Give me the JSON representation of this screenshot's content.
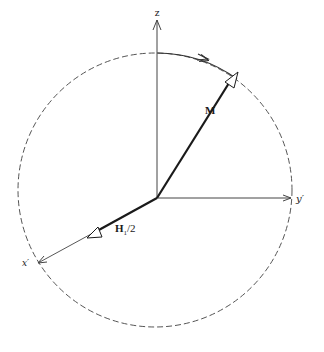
{
  "diagram": {
    "title": "",
    "colors": {
      "background": "#ffffff",
      "line": "#1a1a1a",
      "axis": "#444444",
      "circle": "#555555"
    },
    "axes": {
      "z": {
        "label": "z"
      },
      "y": {
        "label": "y′"
      },
      "x": {
        "label": "x′"
      }
    },
    "vectors": {
      "magnetization": {
        "label": "M"
      },
      "field": {
        "label_main": "H",
        "label_sub": "1",
        "label_suffix": "/2"
      }
    },
    "path": {
      "type": "circle",
      "solid_arc": "from +z toward M, with direction arrow",
      "remainder": "dashed"
    }
  }
}
